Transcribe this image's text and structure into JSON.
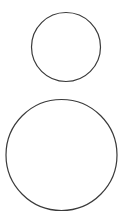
{
  "canvas": {
    "width": 122,
    "height": 222,
    "background_color": "#ffffff",
    "title": "two-circles-figure"
  },
  "figure": {
    "shape_count": 2,
    "shape_type": "circle",
    "stroke_color": "#3a3a3a",
    "fill_color": "#ffffff",
    "stroke_width": 1.2
  },
  "shapes": [
    {
      "name": "small-circle",
      "label": "Small circle",
      "cx": 66,
      "cy": 47,
      "r": 34.5,
      "diameter": 69,
      "stroke_color": "#3a3a3a",
      "fill_color": "#ffffff",
      "stroke_width": 1.2
    },
    {
      "name": "large-circle",
      "label": "Large circle",
      "cx": 61.5,
      "cy": 155,
      "r": 55.5,
      "diameter": 111,
      "stroke_color": "#3a3a3a",
      "fill_color": "#ffffff",
      "stroke_width": 1.2
    }
  ]
}
